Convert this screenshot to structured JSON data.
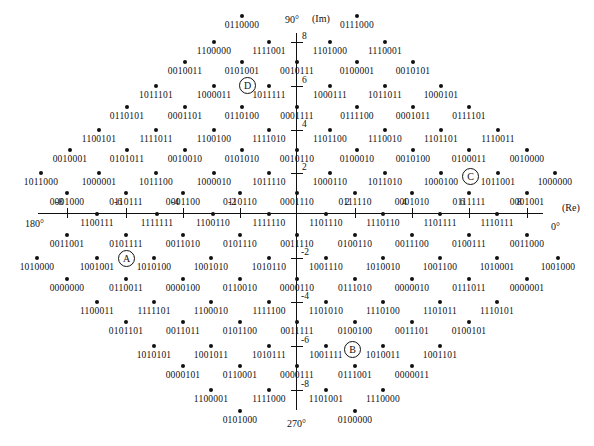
{
  "axes": {
    "imag_label": "(Im)",
    "real_label": "(Re)",
    "angle_top": "90°",
    "angle_bottom": "270°",
    "angle_left": "180°",
    "angle_right": "0°",
    "x_ticks": [
      "-8",
      "-6",
      "-4",
      "-2",
      "2",
      "4",
      "6",
      "8"
    ],
    "y_ticks": [
      "8",
      "6",
      "4",
      "2",
      "-2",
      "-4",
      "-6",
      "-8"
    ]
  },
  "markers": [
    {
      "label": "D",
      "x": 247,
      "y": 85
    },
    {
      "label": "C",
      "x": 470,
      "y": 176
    },
    {
      "label": "A",
      "x": 126,
      "y": 258
    },
    {
      "label": "B",
      "x": 352,
      "y": 349
    }
  ],
  "points": [
    {
      "code": "0110000",
      "x": 242,
      "y": 16
    },
    {
      "code": "0111000",
      "x": 357,
      "y": 16
    },
    {
      "code": "1100000",
      "x": 214,
      "y": 42
    },
    {
      "code": "1111001",
      "x": 269,
      "y": 42
    },
    {
      "code": "1101000",
      "x": 330,
      "y": 42
    },
    {
      "code": "1110001",
      "x": 385,
      "y": 42
    },
    {
      "code": "0010011",
      "x": 185,
      "y": 62
    },
    {
      "code": "0101001",
      "x": 242,
      "y": 62
    },
    {
      "code": "0010111",
      "x": 297,
      "y": 62
    },
    {
      "code": "0100001",
      "x": 357,
      "y": 62
    },
    {
      "code": "0010101",
      "x": 413,
      "y": 62
    },
    {
      "code": "1011101",
      "x": 156,
      "y": 86
    },
    {
      "code": "1000011",
      "x": 214,
      "y": 86
    },
    {
      "code": "1011111",
      "x": 269,
      "y": 86
    },
    {
      "code": "1000111",
      "x": 330,
      "y": 86
    },
    {
      "code": "1011011",
      "x": 385,
      "y": 86
    },
    {
      "code": "1000101",
      "x": 441,
      "y": 86
    },
    {
      "code": "0110101",
      "x": 127,
      "y": 107
    },
    {
      "code": "0001101",
      "x": 185,
      "y": 107
    },
    {
      "code": "0110100",
      "x": 242,
      "y": 107
    },
    {
      "code": "0001111",
      "x": 297,
      "y": 107
    },
    {
      "code": "0111100",
      "x": 357,
      "y": 107
    },
    {
      "code": "0001011",
      "x": 413,
      "y": 107
    },
    {
      "code": "0111101",
      "x": 469,
      "y": 107
    },
    {
      "code": "1100101",
      "x": 99,
      "y": 130
    },
    {
      "code": "1111011",
      "x": 156,
      "y": 130
    },
    {
      "code": "1100100",
      "x": 214,
      "y": 130
    },
    {
      "code": "1111010",
      "x": 269,
      "y": 130
    },
    {
      "code": "1101100",
      "x": 330,
      "y": 130
    },
    {
      "code": "1110010",
      "x": 385,
      "y": 130
    },
    {
      "code": "1101101",
      "x": 441,
      "y": 130
    },
    {
      "code": "1110011",
      "x": 498,
      "y": 130
    },
    {
      "code": "0010001",
      "x": 70,
      "y": 150
    },
    {
      "code": "0101011",
      "x": 127,
      "y": 150
    },
    {
      "code": "0010010",
      "x": 185,
      "y": 150
    },
    {
      "code": "0101010",
      "x": 242,
      "y": 150
    },
    {
      "code": "0010110",
      "x": 297,
      "y": 150
    },
    {
      "code": "0100010",
      "x": 357,
      "y": 150
    },
    {
      "code": "0010100",
      "x": 413,
      "y": 150
    },
    {
      "code": "0100011",
      "x": 469,
      "y": 150
    },
    {
      "code": "0010000",
      "x": 527,
      "y": 150
    },
    {
      "code": "1011000",
      "x": 41,
      "y": 173
    },
    {
      "code": "1000001",
      "x": 99,
      "y": 173
    },
    {
      "code": "1011100",
      "x": 156,
      "y": 173
    },
    {
      "code": "1000010",
      "x": 214,
      "y": 173
    },
    {
      "code": "1011110",
      "x": 269,
      "y": 173
    },
    {
      "code": "1000110",
      "x": 330,
      "y": 173
    },
    {
      "code": "1011010",
      "x": 385,
      "y": 173
    },
    {
      "code": "1000100",
      "x": 441,
      "y": 173
    },
    {
      "code": "1011001",
      "x": 498,
      "y": 173
    },
    {
      "code": "1000000",
      "x": 555,
      "y": 173
    },
    {
      "code": "0001000",
      "x": 67,
      "y": 193
    },
    {
      "code": "0110111",
      "x": 126,
      "y": 193
    },
    {
      "code": "0001100",
      "x": 183,
      "y": 193
    },
    {
      "code": "0110110",
      "x": 240,
      "y": 193
    },
    {
      "code": "0001110",
      "x": 297,
      "y": 193
    },
    {
      "code": "0111110",
      "x": 355,
      "y": 193
    },
    {
      "code": "0001010",
      "x": 412,
      "y": 193
    },
    {
      "code": "0111111",
      "x": 469,
      "y": 193
    },
    {
      "code": "0001001",
      "x": 527,
      "y": 193
    },
    {
      "code": "1100111",
      "x": 97,
      "y": 214
    },
    {
      "code": "1111111",
      "x": 157,
      "y": 214
    },
    {
      "code": "1100110",
      "x": 213,
      "y": 214
    },
    {
      "code": "1111110",
      "x": 269,
      "y": 214
    },
    {
      "code": "1101110",
      "x": 326,
      "y": 214
    },
    {
      "code": "1110110",
      "x": 383,
      "y": 214
    },
    {
      "code": "1101111",
      "x": 440,
      "y": 214
    },
    {
      "code": "1110111",
      "x": 497,
      "y": 214
    },
    {
      "code": "0011001",
      "x": 67,
      "y": 235
    },
    {
      "code": "0101111",
      "x": 126,
      "y": 235
    },
    {
      "code": "0011010",
      "x": 183,
      "y": 235
    },
    {
      "code": "0101110",
      "x": 240,
      "y": 235
    },
    {
      "code": "0011110",
      "x": 297,
      "y": 235
    },
    {
      "code": "0100110",
      "x": 355,
      "y": 235
    },
    {
      "code": "0011100",
      "x": 412,
      "y": 235
    },
    {
      "code": "0100111",
      "x": 469,
      "y": 235
    },
    {
      "code": "0011000",
      "x": 527,
      "y": 235
    },
    {
      "code": "1010000",
      "x": 37,
      "y": 258
    },
    {
      "code": "1001001",
      "x": 97,
      "y": 258
    },
    {
      "code": "1010100",
      "x": 154,
      "y": 258
    },
    {
      "code": "1001010",
      "x": 211,
      "y": 258
    },
    {
      "code": "1010110",
      "x": 269,
      "y": 258
    },
    {
      "code": "1001110",
      "x": 326,
      "y": 258
    },
    {
      "code": "1010010",
      "x": 383,
      "y": 258
    },
    {
      "code": "1001100",
      "x": 440,
      "y": 258
    },
    {
      "code": "1010001",
      "x": 497,
      "y": 258
    },
    {
      "code": "1001000",
      "x": 558,
      "y": 258
    },
    {
      "code": "0000000",
      "x": 67,
      "y": 279
    },
    {
      "code": "0110011",
      "x": 126,
      "y": 279
    },
    {
      "code": "0000100",
      "x": 183,
      "y": 279
    },
    {
      "code": "0110010",
      "x": 240,
      "y": 279
    },
    {
      "code": "0000110",
      "x": 297,
      "y": 279
    },
    {
      "code": "0111010",
      "x": 355,
      "y": 279
    },
    {
      "code": "0000010",
      "x": 412,
      "y": 279
    },
    {
      "code": "0111011",
      "x": 469,
      "y": 279
    },
    {
      "code": "0000001",
      "x": 527,
      "y": 279
    },
    {
      "code": "1100011",
      "x": 97,
      "y": 302
    },
    {
      "code": "1111101",
      "x": 154,
      "y": 302
    },
    {
      "code": "1100010",
      "x": 211,
      "y": 302
    },
    {
      "code": "1111100",
      "x": 269,
      "y": 302
    },
    {
      "code": "1101010",
      "x": 326,
      "y": 302
    },
    {
      "code": "1110100",
      "x": 383,
      "y": 302
    },
    {
      "code": "1101011",
      "x": 440,
      "y": 302
    },
    {
      "code": "1110101",
      "x": 497,
      "y": 302
    },
    {
      "code": "0101101",
      "x": 126,
      "y": 322
    },
    {
      "code": "0011011",
      "x": 183,
      "y": 322
    },
    {
      "code": "0101100",
      "x": 240,
      "y": 322
    },
    {
      "code": "0011111",
      "x": 297,
      "y": 322
    },
    {
      "code": "0100100",
      "x": 355,
      "y": 322
    },
    {
      "code": "0011101",
      "x": 412,
      "y": 322
    },
    {
      "code": "0100101",
      "x": 469,
      "y": 322
    },
    {
      "code": "1010101",
      "x": 154,
      "y": 346
    },
    {
      "code": "1001011",
      "x": 211,
      "y": 346
    },
    {
      "code": "1010111",
      "x": 269,
      "y": 346
    },
    {
      "code": "1001111",
      "x": 326,
      "y": 346
    },
    {
      "code": "1010011",
      "x": 383,
      "y": 346
    },
    {
      "code": "1001101",
      "x": 440,
      "y": 346
    },
    {
      "code": "0000101",
      "x": 183,
      "y": 366
    },
    {
      "code": "0110001",
      "x": 240,
      "y": 366
    },
    {
      "code": "0000111",
      "x": 297,
      "y": 366
    },
    {
      "code": "0111001",
      "x": 355,
      "y": 366
    },
    {
      "code": "0000011",
      "x": 412,
      "y": 366
    },
    {
      "code": "1100001",
      "x": 211,
      "y": 390
    },
    {
      "code": "1111000",
      "x": 269,
      "y": 390
    },
    {
      "code": "1101001",
      "x": 326,
      "y": 390
    },
    {
      "code": "1110000",
      "x": 383,
      "y": 390
    },
    {
      "code": "0101000",
      "x": 240,
      "y": 411
    },
    {
      "code": "0100000",
      "x": 355,
      "y": 411
    }
  ]
}
